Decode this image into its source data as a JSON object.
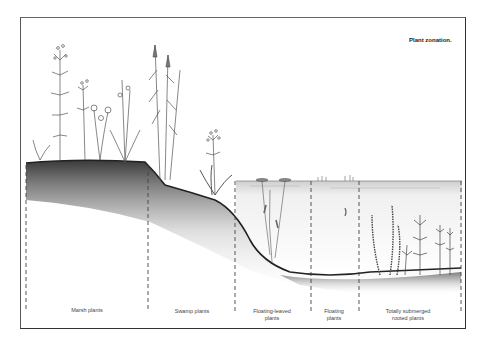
{
  "figure": {
    "title": "Plant zonation.",
    "water_surface_y": 181,
    "colors": {
      "frame": "#333333",
      "soil_dark": "#3a3a3a",
      "soil_light": "#ffffff",
      "water": "#e8e8e8",
      "plant_line": "#555555"
    }
  },
  "zones": [
    {
      "id": "marsh",
      "label": "Marsh plants",
      "label_line2": "",
      "x_start": 26,
      "x_end": 148
    },
    {
      "id": "swamp",
      "label": "Swamp plants",
      "label_line2": "",
      "x_start": 148,
      "x_end": 235
    },
    {
      "id": "floating-leaved",
      "label": "Floating-leaved",
      "label_line2": "plants",
      "x_start": 235,
      "x_end": 311
    },
    {
      "id": "floating",
      "label": "Floating",
      "label_line2": "plants",
      "x_start": 311,
      "x_end": 359
    },
    {
      "id": "submerged",
      "label": "Totally submerged",
      "label_line2": "rooted plants",
      "x_start": 359,
      "x_end": 461
    }
  ],
  "dividers_x": [
    26,
    148,
    235,
    311,
    359,
    461
  ]
}
